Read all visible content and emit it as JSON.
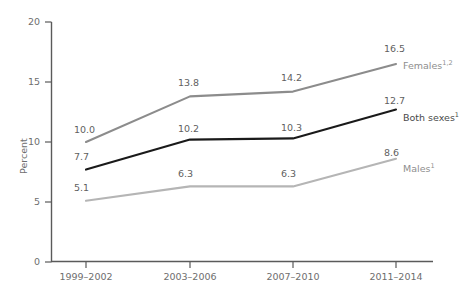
{
  "chart_data": {
    "type": "line",
    "title": "",
    "subtitle": "",
    "xlabel": "",
    "ylabel": "Percent",
    "categories": [
      "1999–2002",
      "2003–2006",
      "2007–2010",
      "2011–2014"
    ],
    "ylim": [
      0,
      20
    ],
    "yticks": [
      0,
      5,
      10,
      15,
      20
    ],
    "grid": false,
    "legend": "inline-right-of-last-point",
    "series": [
      {
        "name": "Females",
        "name_sup": "1,2",
        "color": "#8c8c8c",
        "values": [
          10.0,
          13.8,
          14.2,
          16.5
        ],
        "labels": [
          "10.0",
          "13.8",
          "14.2",
          "16.5"
        ]
      },
      {
        "name": "Both sexes",
        "name_sup": "1",
        "color": "#1a1a1a",
        "values": [
          7.7,
          10.2,
          10.3,
          12.7
        ],
        "labels": [
          "7.7",
          "10.2",
          "10.3",
          "12.7"
        ]
      },
      {
        "name": "Males",
        "name_sup": "1",
        "color": "#b5b5b5",
        "values": [
          5.1,
          6.3,
          6.3,
          8.6
        ],
        "labels": [
          "5.1",
          "6.3",
          "6.3",
          "8.6"
        ]
      }
    ]
  },
  "axis": {
    "y_tick_0": "0",
    "y_tick_5": "5",
    "y_tick_10": "10",
    "y_tick_15": "15",
    "y_tick_20": "20",
    "y_title": "Percent",
    "x_tick_1": "1999–2002",
    "x_tick_2": "2003–2006",
    "x_tick_3": "2007–2010",
    "x_tick_4": "2011–2014"
  },
  "data_labels": {
    "females_1": "10.0",
    "females_2": "13.8",
    "females_3": "14.2",
    "females_4": "16.5",
    "both_1": "7.7",
    "both_2": "10.2",
    "both_3": "10.3",
    "both_4": "12.7",
    "males_1": "5.1",
    "males_2": "6.3",
    "males_3": "6.3",
    "males_4": "8.6"
  },
  "series_labels": {
    "females": "Females",
    "females_sup": "1,2",
    "both_sexes": "Both sexes",
    "both_sexes_sup": "1",
    "males": "Males",
    "males_sup": "1"
  }
}
